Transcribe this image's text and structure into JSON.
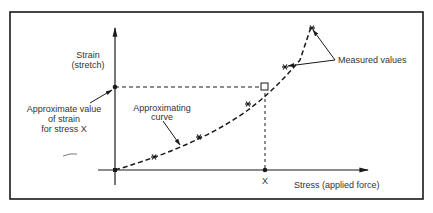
{
  "diagram": {
    "y_axis_label": [
      "Strain",
      "(stretch)"
    ],
    "x_axis_label": "Stress (applied force)",
    "x_marker_label": "X",
    "approx_value_label": [
      "Approximate value",
      "of strain",
      "for stress X"
    ],
    "approx_curve_label": [
      "Approximating",
      "curve"
    ],
    "measured_label": "Measured values",
    "colors": {
      "ink": "#1a1a1a",
      "text": "#333333",
      "background": "#ffffff"
    }
  }
}
